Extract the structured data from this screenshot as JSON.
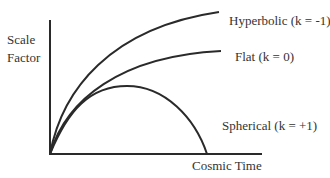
{
  "axes": {
    "y_label_line1": "Scale",
    "y_label_line2": "Factor",
    "x_label": "Cosmic Time"
  },
  "curves": [
    {
      "id": "hyperbolic",
      "label": "Hyperbolic (k = -1)",
      "k": -1,
      "behavior": "expands forever, fastest"
    },
    {
      "id": "flat",
      "label": "Flat (k = 0)",
      "k": 0,
      "behavior": "expands forever, decelerating"
    },
    {
      "id": "spherical",
      "label": "Spherical (k = +1)",
      "k": 1,
      "behavior": "expands then recollapses"
    }
  ],
  "colors": {
    "line": "#2a2a2a",
    "text": "#333333",
    "background": "#ffffff"
  }
}
